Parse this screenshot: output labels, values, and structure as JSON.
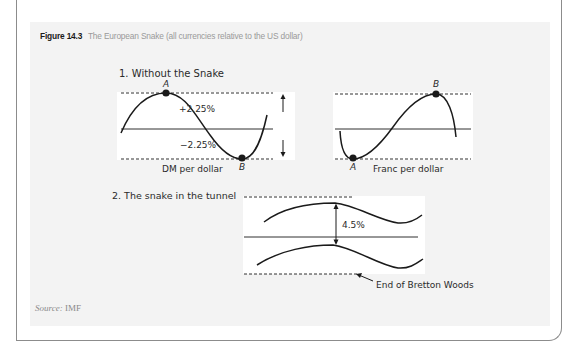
{
  "figure": {
    "number": "Figure 14.3",
    "caption": "The European Snake (all currencies relative to the US dollar)",
    "source_label": "Source:",
    "source_value": "IMF"
  },
  "panel1": {
    "title": "1. Without the Snake",
    "left_chart": {
      "label": "DM per dollar",
      "point_a": "A",
      "point_b": "B",
      "upper_band": "+2.25%",
      "lower_band": "−2.25%"
    },
    "right_chart": {
      "label": "Franc per dollar",
      "point_a": "A",
      "point_b": "B"
    }
  },
  "panel2": {
    "title": "2. The snake in the tunnel",
    "band_width": "4.5%",
    "annotation": "End of Bretton Woods"
  },
  "colors": {
    "panel_background": "#f3f3f3",
    "plot_background": "#ffffff",
    "line": "#1a1a1a",
    "caption_gray": "#9a9a9a",
    "border": "#8c8c8c"
  }
}
